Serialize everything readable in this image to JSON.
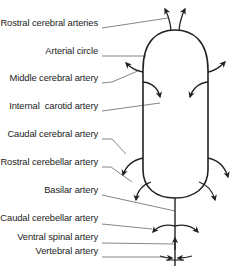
{
  "diagram": {
    "type": "arterial-anatomy",
    "labels": [
      {
        "id": "rostral-cerebral-arteries",
        "text": "Rostral cerebral arteries",
        "y": 22
      },
      {
        "id": "arterial-circle",
        "text": "Arterial circle",
        "y": 50
      },
      {
        "id": "middle-cerebral-artery",
        "text": "Middle cerebral artery",
        "y": 77
      },
      {
        "id": "internal-carotid-artery",
        "text": "Internal  carotid artery",
        "y": 104
      },
      {
        "id": "caudal-cerebral-artery",
        "text": "Caudal cerebral artery",
        "y": 133
      },
      {
        "id": "rostral-cerebellar-artery",
        "text": "Rostral cerebellar artery",
        "y": 161
      },
      {
        "id": "basilar-artery",
        "text": "Basilar artery",
        "y": 189
      },
      {
        "id": "caudal-cerebellar-artery",
        "text": "Caudal cerebellar artery",
        "y": 217
      },
      {
        "id": "ventral-spinal-artery",
        "text": "Ventral spinal artery",
        "y": 236
      },
      {
        "id": "vertebral-artery",
        "text": "Vertebral artery",
        "y": 250
      }
    ],
    "line_color": "#222222",
    "leader_color": "#333333"
  }
}
